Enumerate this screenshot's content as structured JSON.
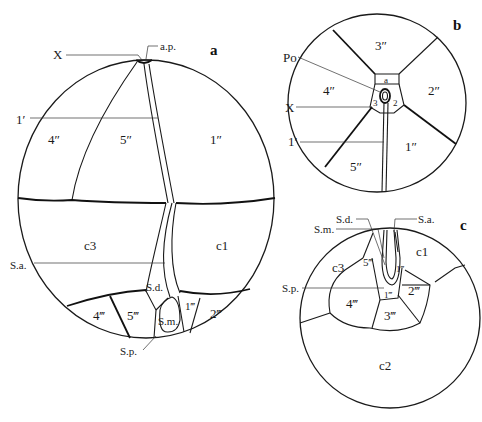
{
  "figure": {
    "panels": [
      {
        "id": "a",
        "letter": "a",
        "plates": {
          "apical": [
            "4″",
            "5″",
            "1″"
          ],
          "cingular": [
            "c3",
            "c1"
          ],
          "postcingular": [
            "4‴",
            "5‴",
            "1‴",
            "2‴"
          ]
        },
        "annotations": {
          "x": "X",
          "ap": "a.p.",
          "one_prime": "1′",
          "sa": "S.a.",
          "sd": "S.d.",
          "sm": "S.m.",
          "sp": "S.p."
        }
      },
      {
        "id": "b",
        "letter": "b",
        "plates": {
          "precingular": [
            "3″",
            "4″",
            "2″",
            "5″",
            "1″"
          ],
          "small": [
            "a",
            "3",
            "2"
          ]
        },
        "annotations": {
          "po": "Po",
          "x": "X",
          "one_prime": "1′"
        }
      },
      {
        "id": "c",
        "letter": "c",
        "plates": {
          "cingular": [
            "c3",
            "c1",
            "c2"
          ],
          "postcingular": [
            "5‴",
            "1‴",
            "2‴",
            "4‴",
            "3‴"
          ],
          "small": [
            "1‴"
          ]
        },
        "annotations": {
          "sd": "S.d.",
          "sa": "S.a.",
          "sm": "S.m.",
          "sp": "S.p."
        }
      }
    ]
  },
  "colors": {
    "line": "#1a1a1a",
    "background": "#ffffff"
  }
}
